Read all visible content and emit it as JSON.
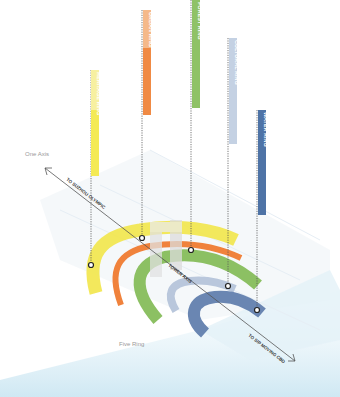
{
  "diagram": {
    "colors": {
      "yellow": "#f2e54a",
      "orange": "#f0823c",
      "green": "#8cc063",
      "lightblue": "#b9c7dc",
      "darkblue": "#4e73a6",
      "water": "#dceff8",
      "site": "#eef3f7"
    },
    "labels": {
      "one_axis": "One Axis",
      "five_ring": "Five Ring",
      "tower_axis": "TOWER AXIS",
      "axis_upper": "TO SUZHOU OLYMPIC",
      "axis_lower": "TO SIP MOVING CBD"
    },
    "rings": [
      {
        "name": "HERITAGE RING",
        "color": "#f2e54a"
      },
      {
        "name": "URBAN RING",
        "color": "#f0823c"
      },
      {
        "name": "FOREST RING",
        "color": "#8cc063"
      },
      {
        "name": "CULTURAL RING",
        "color": "#b9c7dc"
      },
      {
        "name": "WATER RING",
        "color": "#4e73a6"
      }
    ]
  }
}
